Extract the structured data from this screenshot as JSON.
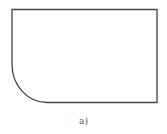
{
  "diagram": {
    "shape": "rectangle-with-rounded-bottom-left-corner",
    "stroke_color": "#444444",
    "stroke_width": 1.3,
    "fill_color": "#ffffff",
    "caption": "a)"
  }
}
